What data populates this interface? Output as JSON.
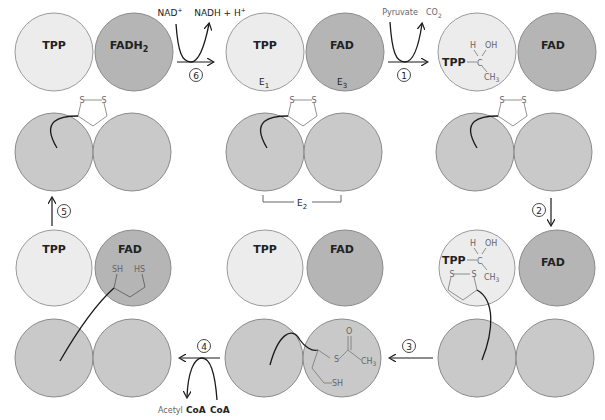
{
  "diagram": {
    "colors": {
      "tpp_fill": "#ececec",
      "fad_fill": "#b5b5b5",
      "e2_fill": "#c9c9c9",
      "outline": "#8a8a8a",
      "line": "#1a1a1a",
      "chem": "#777777"
    },
    "labels": {
      "tpp": "TPP",
      "fad": "FAD",
      "fadh2": "FADH",
      "fadh2_sub": "2",
      "e1": "E",
      "e1_sub": "1",
      "e3": "E",
      "e3_sub": "3",
      "e2": "E",
      "e2_sub": "2"
    },
    "steps": [
      {
        "num": "1",
        "in": "Pyruvate",
        "out": "CO",
        "out_sub": "2"
      },
      {
        "num": "2"
      },
      {
        "num": "3"
      },
      {
        "num": "4",
        "in": "CoA",
        "out_prefix": "Acetyl",
        "out": "CoA"
      },
      {
        "num": "5"
      },
      {
        "num": "6",
        "in": "NAD",
        "in_sup": "+",
        "out": "NADH + H",
        "out_sup": "+"
      }
    ],
    "chem": {
      "s": "S",
      "h": "H",
      "oh": "OH",
      "c": "C",
      "ch3": "CH",
      "ch3_sub": "3",
      "o": "O",
      "sh": "SH",
      "hs": "HS",
      "tpp_bond": "TPP"
    }
  }
}
